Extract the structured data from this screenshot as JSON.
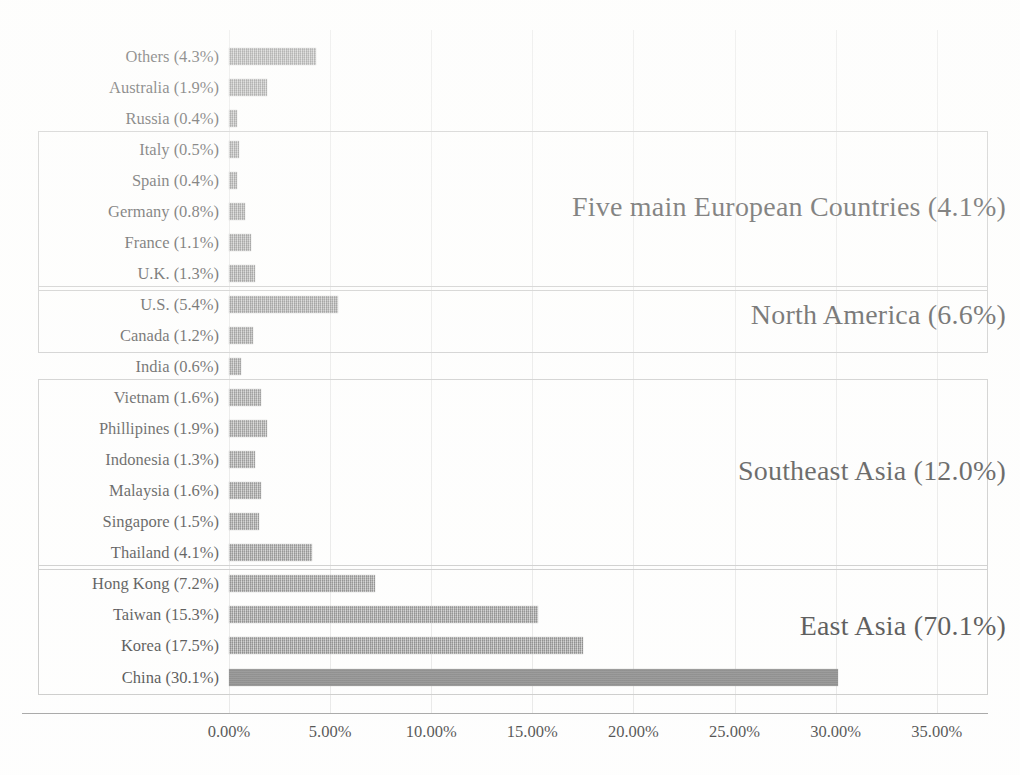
{
  "chart_data": {
    "type": "bar",
    "orientation": "horizontal",
    "title": "",
    "xlabel": "",
    "ylabel": "",
    "xlim": [
      0,
      35
    ],
    "xticks": [
      "0.00%",
      "5.00%",
      "10.00%",
      "15.00%",
      "20.00%",
      "25.00%",
      "30.00%",
      "35.00%"
    ],
    "xtick_values": [
      0,
      5,
      10,
      15,
      20,
      25,
      30,
      35
    ],
    "grid": true,
    "legend": "none",
    "categories": [
      "Others (4.3%)",
      "Australia (1.9%)",
      "Russia (0.4%)",
      "Italy (0.5%)",
      "Spain (0.4%)",
      "Germany (0.8%)",
      "France (1.1%)",
      "U.K. (1.3%)",
      "U.S. (5.4%)",
      "Canada (1.2%)",
      "India (0.6%)",
      "Vietnam (1.6%)",
      "Phillipines (1.9%)",
      "Indonesia (1.3%)",
      "Malaysia (1.6%)",
      "Singapore (1.5%)",
      "Thailand (4.1%)",
      "Hong Kong (7.2%)",
      "Taiwan (15.3%)",
      "Korea (17.5%)",
      "China (30.1%)"
    ],
    "values": [
      4.3,
      1.9,
      0.4,
      0.5,
      0.4,
      0.8,
      1.1,
      1.3,
      5.4,
      1.2,
      0.6,
      1.6,
      1.9,
      1.3,
      1.6,
      1.5,
      4.1,
      7.2,
      15.3,
      17.5,
      30.1
    ],
    "bar_color": "#8a8a8a",
    "highlight_bar_color": "#6c6c6c",
    "annotations": [
      "Five main European Countries (4.1%)",
      "North America (6.6%)",
      "Southeast Asia (12.0%)",
      "East Asia (70.1%)"
    ]
  },
  "rows": [
    {
      "label": "Others (4.3%)",
      "value": 4.3,
      "solid": false
    },
    {
      "label": "Australia (1.9%)",
      "value": 1.9,
      "solid": false
    },
    {
      "label": "Russia (0.4%)",
      "value": 0.4,
      "solid": false
    },
    {
      "label": "Italy (0.5%)",
      "value": 0.5,
      "solid": false
    },
    {
      "label": "Spain (0.4%)",
      "value": 0.4,
      "solid": false
    },
    {
      "label": "Germany (0.8%)",
      "value": 0.8,
      "solid": false
    },
    {
      "label": "France (1.1%)",
      "value": 1.1,
      "solid": false
    },
    {
      "label": "U.K. (1.3%)",
      "value": 1.3,
      "solid": false
    },
    {
      "label": "U.S. (5.4%)",
      "value": 5.4,
      "solid": false
    },
    {
      "label": "Canada (1.2%)",
      "value": 1.2,
      "solid": false
    },
    {
      "label": "India (0.6%)",
      "value": 0.6,
      "solid": false
    },
    {
      "label": "Vietnam (1.6%)",
      "value": 1.6,
      "solid": false
    },
    {
      "label": "Phillipines (1.9%)",
      "value": 1.9,
      "solid": false
    },
    {
      "label": "Indonesia (1.3%)",
      "value": 1.3,
      "solid": false
    },
    {
      "label": "Malaysia (1.6%)",
      "value": 1.6,
      "solid": false
    },
    {
      "label": "Singapore (1.5%)",
      "value": 1.5,
      "solid": false
    },
    {
      "label": "Thailand (4.1%)",
      "value": 4.1,
      "solid": false
    },
    {
      "label": "Hong Kong (7.2%)",
      "value": 7.2,
      "solid": false
    },
    {
      "label": "Taiwan (15.3%)",
      "value": 15.3,
      "solid": false
    },
    {
      "label": "Korea (17.5%)",
      "value": 17.5,
      "solid": false
    },
    {
      "label": "China (30.1%)",
      "value": 30.1,
      "solid": true
    }
  ],
  "groups": [
    {
      "label": "Five main European Countries (4.1%)",
      "first_row": 3,
      "last_row": 7
    },
    {
      "label": "North America (6.6%)",
      "first_row": 8,
      "last_row": 9
    },
    {
      "label": "Southeast Asia (12.0%)",
      "first_row": 11,
      "last_row": 16
    },
    {
      "label": "East Asia (70.1%)",
      "first_row": 17,
      "last_row": 20
    }
  ],
  "xticks": [
    "0.00%",
    "5.00%",
    "10.00%",
    "15.00%",
    "20.00%",
    "25.00%",
    "30.00%",
    "35.00%"
  ]
}
